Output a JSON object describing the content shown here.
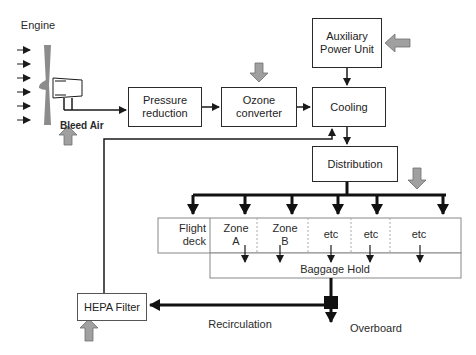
{
  "diagram": {
    "engine_label": "Engine",
    "bleed_air_label": "Bleed Air",
    "boxes": {
      "pressure_reduction": [
        "Pressure",
        "reduction"
      ],
      "ozone_converter": [
        "Ozone",
        "converter"
      ],
      "apu": [
        "Auxiliary",
        "Power Unit"
      ],
      "cooling": "Cooling",
      "distribution": "Distribution",
      "hepa_filter": "HEPA Filter"
    },
    "zones": [
      {
        "line1": "Flight",
        "line2": "deck"
      },
      {
        "line1": "Zone",
        "line2": "A"
      },
      {
        "line1": "Zone",
        "line2": "B"
      },
      {
        "line1": "etc",
        "line2": ""
      },
      {
        "line1": "etc",
        "line2": ""
      },
      {
        "line1": "etc",
        "line2": ""
      }
    ],
    "baggage_hold": "Baggage Hold",
    "recirculation_label": "Recirculation",
    "overboard_label": "Overboard",
    "colors": {
      "line": "#1a1a1a",
      "input_arrow_fill": "#a0a0a0",
      "input_arrow_stroke": "#6e6e6e",
      "fan": "#8c8c8c"
    }
  }
}
